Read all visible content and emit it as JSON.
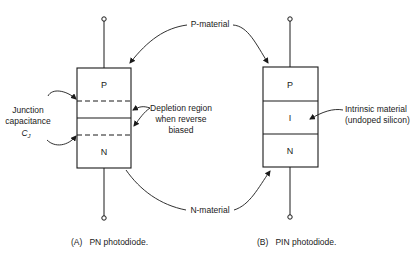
{
  "diagram": {
    "pn": {
      "caption": "(A)   PN photodiode.",
      "layers": {
        "p": "P",
        "n": "N"
      },
      "labels": {
        "junction_line1": "Junction",
        "junction_line2": "capacitance",
        "junction_symbol": "C",
        "junction_subscript": "J",
        "depletion_line1": "Depletion region",
        "depletion_line2": "when reverse",
        "depletion_line3": "biased"
      }
    },
    "pin": {
      "caption": "(B)   PIN photodiode.",
      "layers": {
        "p": "P",
        "i": "I",
        "n": "N"
      },
      "labels": {
        "intrinsic_line1": "Intrinsic material",
        "intrinsic_line2": "(undoped silicon)"
      }
    },
    "shared_labels": {
      "p_material": "P-material",
      "n_material": "N-material"
    },
    "colors": {
      "ink": "#1a1a1a",
      "background": "#ffffff"
    }
  }
}
